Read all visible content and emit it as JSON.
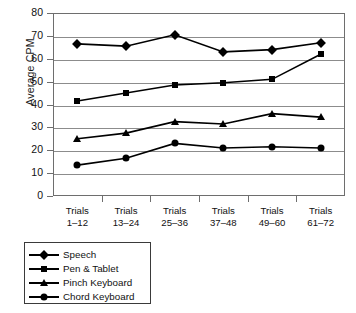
{
  "chart_data": {
    "type": "line",
    "title": "",
    "xlabel": "",
    "ylabel": "Average CPM",
    "ylim": [
      0,
      80
    ],
    "ytick_step": 10,
    "yticks": [
      "80",
      "70",
      "60",
      "50",
      "40",
      "30",
      "20",
      "10",
      "0"
    ],
    "grid": true,
    "legend_position": "below-left",
    "categories": [
      "Trials 1–12",
      "Trials 13–24",
      "Trials 25–36",
      "Trials 37–48",
      "Trials 49–60",
      "Trials 61–72"
    ],
    "category_lines": [
      [
        "Trials",
        "1–12"
      ],
      [
        "Trials",
        "13–24"
      ],
      [
        "Trials",
        "25–36"
      ],
      [
        "Trials",
        "37–48"
      ],
      [
        "Trials",
        "49–60"
      ],
      [
        "Trials",
        "61–72"
      ]
    ],
    "series": [
      {
        "name": "Speech",
        "marker": "diamond",
        "color": "#000000",
        "values": [
          66.5,
          65.5,
          70.5,
          63.0,
          64.0,
          67.0
        ]
      },
      {
        "name": "Pen & Tablet",
        "marker": "square",
        "color": "#000000",
        "values": [
          41.5,
          45.0,
          48.5,
          49.5,
          51.0,
          62.0
        ]
      },
      {
        "name": "Pinch Keyboard",
        "marker": "triangle",
        "color": "#000000",
        "values": [
          25.0,
          27.5,
          32.5,
          31.5,
          36.0,
          34.5
        ]
      },
      {
        "name": "Chord Keyboard",
        "marker": "circle",
        "color": "#000000",
        "values": [
          13.5,
          16.5,
          23.0,
          21.0,
          21.5,
          21.0
        ]
      }
    ]
  }
}
